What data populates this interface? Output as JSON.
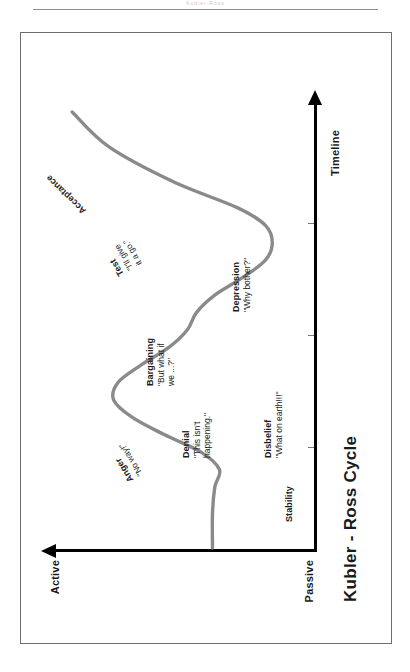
{
  "page": {
    "header_text": "Kubler-Ross"
  },
  "chart_data": {
    "type": "line",
    "title": "Kubler - Ross Cycle",
    "xlabel": "Timeline",
    "ylabel": "",
    "y_axis_top_label": "Active",
    "y_axis_bottom_label": "Passive",
    "grid": false,
    "legend": "none",
    "xlim": [
      0,
      100
    ],
    "ylim": [
      0,
      100
    ],
    "series": [
      {
        "name": "Change curve",
        "color": "#8a8a8a",
        "x": [
          0,
          8,
          14,
          18,
          22,
          26,
          30,
          34,
          38,
          42,
          46,
          50,
          54,
          58,
          62,
          66,
          70,
          74,
          78,
          84,
          92,
          100
        ],
        "y": [
          35,
          35,
          34,
          32,
          40,
          56,
          70,
          78,
          76,
          66,
          54,
          46,
          42,
          34,
          22,
          12,
          9,
          12,
          24,
          52,
          80,
          96
        ]
      }
    ],
    "annotations": [
      {
        "key": "stability",
        "name": "Stability",
        "quote": ""
      },
      {
        "key": "disbelief",
        "name": "Disbelief",
        "quote": "\"What on earth!!!\""
      },
      {
        "key": "denial",
        "name": "Denial",
        "quote": "\"This isn't\nhappening.\""
      },
      {
        "key": "anger",
        "name": "Anger",
        "quote": "\"No way!\""
      },
      {
        "key": "bargaining",
        "name": "Bargaining",
        "quote": "\"But what if\nwe ...?\""
      },
      {
        "key": "depression",
        "name": "Depression",
        "quote": "\"Why bother?\""
      },
      {
        "key": "test",
        "name": "Test",
        "quote": "\"I'll give\nit a go.\""
      },
      {
        "key": "acceptance",
        "name": "Acceptance",
        "quote": ""
      }
    ]
  },
  "annotations_flat": {
    "stability_name": "Stability",
    "stability_quote": "",
    "disbelief_name": "Disbelief",
    "disbelief_quote": "\"What on earth!!!\"",
    "denial_name": "Denial",
    "denial_quote_1": "\"This isn't",
    "denial_quote_2": "happening.\"",
    "anger_name": "Anger",
    "anger_quote": "\"No way!\"",
    "bargaining_name": "Bargaining",
    "bargaining_quote_1": "\"But what if",
    "bargaining_quote_2": "we ...?\"",
    "depression_name": "Depression",
    "depression_quote": "\"Why bother?\"",
    "test_name": "Test",
    "test_quote_1": "\"I'll give",
    "test_quote_2": "it a go.\"",
    "acceptance_name": "Acceptance",
    "acceptance_quote": ""
  },
  "colors": {
    "curve": "#8a8a8a",
    "axis": "#000000",
    "frame": "#6f6f6f",
    "text": "#1a1a1a"
  }
}
